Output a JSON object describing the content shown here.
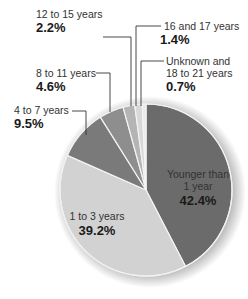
{
  "chart_data": {
    "type": "pie",
    "title": "",
    "categories": [
      "Younger than 1 year",
      "1 to 3 years",
      "4 to 7 years",
      "8 to 11 years",
      "12 to 15 years",
      "16 and 17 years",
      "Unknown and 18 to 21 years"
    ],
    "values": [
      42.4,
      39.2,
      9.5,
      4.6,
      2.2,
      1.4,
      0.7
    ],
    "value_labels": [
      "42.4%",
      "39.2%",
      "9.5%",
      "4.6%",
      "2.2%",
      "1.4%",
      "0.7%"
    ],
    "colors": [
      "#6b6b6b",
      "#d2d2d2",
      "#7a7a7a",
      "#8e8e8e",
      "#b4b4b4",
      "#d8d8d8",
      "#eaeaea"
    ],
    "legend": "none (direct labels with leader lines)"
  },
  "labels": {
    "s0": {
      "line1": "Younger than",
      "line2": "1 year",
      "pct": "42.4%"
    },
    "s1": {
      "line1": "1 to 3 years",
      "pct": "39.2%"
    },
    "s2": {
      "line1": "4 to 7 years",
      "pct": "9.5%"
    },
    "s3": {
      "line1": "8 to 11 years",
      "pct": "4.6%"
    },
    "s4": {
      "line1": "12 to 15 years",
      "pct": "2.2%"
    },
    "s5": {
      "line1": "16 and 17 years",
      "pct": "1.4%"
    },
    "s6": {
      "line1": "Unknown and",
      "line2": "18 to 21 years",
      "pct": "0.7%"
    }
  }
}
